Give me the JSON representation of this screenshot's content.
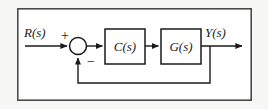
{
  "figure": {
    "kind": "control-system-block-diagram",
    "frame": {
      "x": 17,
      "y": 8,
      "width": 235,
      "height": 93,
      "border_color": "#4a4a4a",
      "fill_color": "#ffffff"
    },
    "page_background": "#f7f7f5",
    "ink_color": "#1a1a1a"
  },
  "labels": {
    "input_signal": "R(s)",
    "output_signal": "Y(s)",
    "sum_positive": "+",
    "sum_negative": "−"
  },
  "blocks": [
    {
      "id": "controller",
      "label": "C(s)",
      "x": 105,
      "y": 29,
      "width": 40,
      "height": 35
    },
    {
      "id": "plant",
      "label": "G(s)",
      "x": 161,
      "y": 29,
      "width": 40,
      "height": 35
    }
  ],
  "summing_junction": {
    "id": "summer",
    "cx": 78,
    "cy": 46,
    "r": 8.5,
    "positive_input": "left",
    "negative_input": "bottom"
  },
  "signals": {
    "input_line": {
      "x1": 25,
      "y1": 46,
      "x2": 69,
      "y2": 46
    },
    "summer_to_controller": {
      "x1": 87,
      "y1": 46,
      "x2": 104,
      "y2": 46
    },
    "controller_to_plant": {
      "x1": 145,
      "y1": 46,
      "x2": 160,
      "y2": 46
    },
    "plant_to_output": {
      "x1": 201,
      "y1": 46,
      "x2": 244,
      "y2": 46
    },
    "feedback_takeoff": {
      "x": 210,
      "y": 46
    },
    "feedback_down": {
      "x1": 210,
      "y1": 46,
      "x2": 210,
      "y2": 83
    },
    "feedback_left": {
      "x1": 210,
      "y1": 83,
      "x2": 78,
      "y2": 83
    },
    "feedback_up": {
      "x1": 78,
      "y1": 83,
      "x2": 78,
      "y2": 56
    }
  },
  "label_positions": {
    "input_signal": {
      "x": 24,
      "y": 36
    },
    "output_signal": {
      "x": 206,
      "y": 36
    },
    "sum_positive": {
      "x": 61,
      "y": 38
    },
    "sum_negative": {
      "x": 88,
      "y": 65
    }
  }
}
